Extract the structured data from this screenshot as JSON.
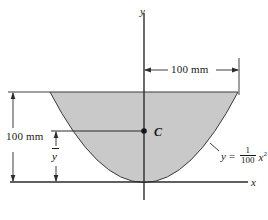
{
  "figure": {
    "axes": {
      "x_label": "x",
      "y_label": "y",
      "origin_px": [
        144,
        182
      ]
    },
    "shape": {
      "name": "parabolic-segment",
      "fill_color": "#c9c9c9",
      "stroke_color": "#3a3a3a",
      "curve_equation_plain": "y = (1/100) x^2",
      "half_width_mm": 100,
      "height_mm": 100
    },
    "equation": {
      "lhs": "y",
      "equals": "=",
      "numerator": "1",
      "denominator": "100",
      "variable": "x",
      "exponent": "2"
    },
    "centroid": {
      "label": "C",
      "marker": "filled-dot",
      "position_px": [
        144,
        131
      ]
    },
    "dimensions": [
      {
        "name": "horizontal-half-width",
        "label": "100 mm",
        "orientation": "horizontal",
        "from_px": [
          144,
          70
        ],
        "to_px": [
          239,
          70
        ]
      },
      {
        "name": "vertical-total-height",
        "label": "100 mm",
        "orientation": "vertical",
        "from_px": [
          13,
          92
        ],
        "to_px": [
          13,
          182
        ]
      },
      {
        "name": "vertical-centroid-height",
        "label": "y-bar",
        "label_plain": "y",
        "orientation": "vertical",
        "from_px": [
          56,
          131
        ],
        "to_px": [
          56,
          182
        ]
      }
    ]
  }
}
